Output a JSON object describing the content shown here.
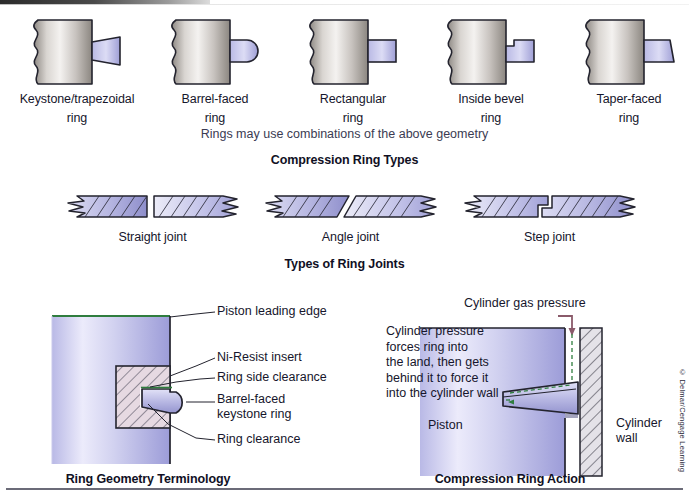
{
  "figure": {
    "copyright": "© Delmar/Cengage Learning"
  },
  "section_ring_types": {
    "caption": "Compression Ring Types",
    "note": "Rings may use combinations of the above geometry",
    "items": [
      {
        "name": "keystone-trapezoidal-ring",
        "line1": "Keystone/trapezoidal",
        "line2": "ring",
        "profile": "trapezoid"
      },
      {
        "name": "barrel-faced-ring",
        "line1": "Barrel-faced",
        "line2": "ring",
        "profile": "barrel"
      },
      {
        "name": "rectangular-ring",
        "line1": "Rectangular",
        "line2": "ring",
        "profile": "rectangle"
      },
      {
        "name": "inside-bevel-ring",
        "line1": "Inside bevel",
        "line2": "ring",
        "profile": "inside-bevel"
      },
      {
        "name": "taper-faced-ring",
        "line1": "Taper-faced",
        "line2": "ring",
        "profile": "taper"
      }
    ]
  },
  "section_ring_joints": {
    "caption": "Types of Ring Joints",
    "items": [
      {
        "name": "straight-joint",
        "label": "Straight joint",
        "joint": "straight"
      },
      {
        "name": "angle-joint",
        "label": "Angle joint",
        "joint": "angle"
      },
      {
        "name": "step-joint",
        "label": "Step joint",
        "joint": "step"
      }
    ]
  },
  "section_ring_geometry": {
    "caption": "Ring Geometry Terminology",
    "callouts": [
      {
        "name": "piston-leading-edge",
        "text": "Piston leading edge"
      },
      {
        "name": "ni-resist-insert",
        "text": "Ni-Resist insert"
      },
      {
        "name": "ring-side-clearance",
        "text": "Ring side clearance"
      },
      {
        "name": "barrel-faced-keystone-ring-line1",
        "text": "Barrel-faced"
      },
      {
        "name": "barrel-faced-keystone-ring-line2",
        "text": "keystone ring"
      },
      {
        "name": "ring-clearance",
        "text": "Ring clearance"
      }
    ]
  },
  "section_ring_action": {
    "caption": "Compression Ring Action",
    "gas_pressure_label": "Cylinder gas pressure",
    "body_lines": [
      "Cylinder pressure",
      "forces ring into",
      "the land, then gets",
      "behind it to force it",
      "into the cylinder wall"
    ],
    "piston_label": "Piston",
    "cylinder_wall_line1": "Cylinder",
    "cylinder_wall_line2": "wall"
  },
  "colors": {
    "ring_fill_light": "#d8d8f2",
    "ring_fill_mid": "#9d9ed4",
    "piston_light": "#e9e9fb",
    "piston_mid": "#a9a9e0",
    "metal_light": "#f0eeec",
    "metal_mid": "#9b9691",
    "outline": "#23232e",
    "green_line": "#2f7d3e"
  }
}
